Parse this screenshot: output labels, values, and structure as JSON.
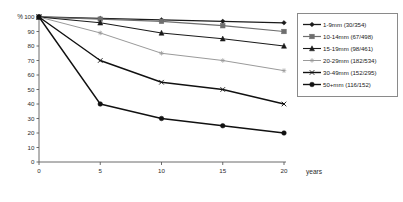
{
  "chart_data": {
    "type": "line",
    "title": "",
    "xlabel": "years",
    "ylabel": "%",
    "x": [
      0,
      5,
      10,
      15,
      20
    ],
    "xticks": [
      "0",
      "5",
      "10",
      "15",
      "20"
    ],
    "yticks": [
      "100",
      "90",
      "80",
      "70",
      "60",
      "50",
      "40",
      "30",
      "20",
      "10",
      "0"
    ],
    "xlim": [
      0,
      20
    ],
    "ylim": [
      0,
      100
    ],
    "grid": false,
    "legend_position": "right",
    "series": [
      {
        "name": "1-9mm (30/354)",
        "label": "1-9mm (30/354)",
        "size_range": "1-9mm",
        "events": 30,
        "total": 354,
        "values": [
          100,
          99,
          98,
          97,
          96
        ],
        "color": "#1a1a1a",
        "marker": "diamond",
        "width": 1.3
      },
      {
        "name": "10-14mm (67/498)",
        "label": "10-14mm (67/498)",
        "size_range": "10-14mm",
        "events": 67,
        "total": 498,
        "values": [
          100,
          98.5,
          97,
          94,
          90
        ],
        "color": "#6e6e6e",
        "marker": "square",
        "width": 1.2
      },
      {
        "name": "15-19mm (98/461)",
        "label": "15-19mm (98/461)",
        "size_range": "15-19mm",
        "events": 98,
        "total": 461,
        "values": [
          100,
          96,
          89,
          85,
          80
        ],
        "color": "#1a1a1a",
        "marker": "triangle",
        "width": 1.1
      },
      {
        "name": "20-29mm (182/534)",
        "label": "20-29mm (182/534)",
        "size_range": "20-29mm",
        "events": 182,
        "total": 534,
        "values": [
          100,
          89,
          75,
          70,
          63
        ],
        "color": "#9a9a9a",
        "marker": "star",
        "width": 1.0
      },
      {
        "name": "30-49mm (152/295)",
        "label": "30-49mm (152/295)",
        "size_range": "30-49mm",
        "events": 152,
        "total": 295,
        "values": [
          100,
          70,
          55,
          50,
          40
        ],
        "color": "#111111",
        "marker": "cross",
        "width": 1.4
      },
      {
        "name": "50+mm (116/152)",
        "label": "50+mm (116/152)",
        "size_range": "50+mm",
        "events": 116,
        "total": 152,
        "values": [
          100,
          40,
          30,
          25,
          20
        ],
        "color": "#111111",
        "marker": "circle",
        "width": 1.4
      }
    ]
  }
}
